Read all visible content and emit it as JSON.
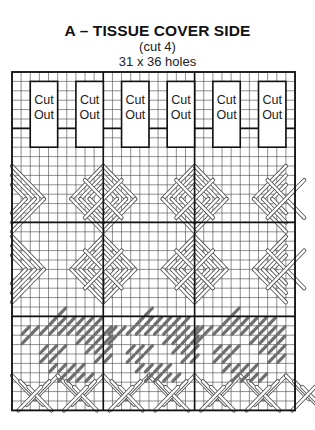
{
  "header": {
    "title": "A – TISSUE COVER SIDE",
    "subtitle": "(cut 4)",
    "dimensions": "31 x 36 holes"
  },
  "grid": {
    "cols": 31,
    "rows": 36,
    "left": 12,
    "top": 72,
    "cell_w": 9.13,
    "cell_h": 9.4,
    "major_every": 10,
    "major_cols": [
      10,
      20
    ],
    "major_rows": [
      6,
      16,
      26
    ],
    "line_color": "#444444",
    "major_color": "#111111"
  },
  "cutouts": {
    "label_line1": "Cut",
    "label_line2": "Out",
    "boxes": [
      {
        "col": 2,
        "row": 1,
        "w": 3,
        "h": 7
      },
      {
        "col": 7,
        "row": 1,
        "w": 3,
        "h": 7
      },
      {
        "col": 12,
        "row": 1,
        "w": 3,
        "h": 7
      },
      {
        "col": 17,
        "row": 1,
        "w": 3,
        "h": 7
      },
      {
        "col": 22,
        "row": 1,
        "w": 3,
        "h": 7
      },
      {
        "col": 27,
        "row": 1,
        "w": 3,
        "h": 7
      }
    ]
  },
  "stitch_bands": {
    "white_diagonal_color": "#ffffff",
    "diamond_band": {
      "row_start": 10,
      "row_end": 25,
      "repeat_cols": 10
    },
    "bottom_band": {
      "row_start": 32,
      "row_end": 36,
      "repeat_cols": 10
    },
    "gray_motif": {
      "row_start": 25,
      "row_end": 32,
      "color": "#6e6e6e",
      "repeat_cols": 10
    }
  }
}
